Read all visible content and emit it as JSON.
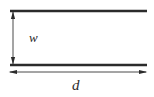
{
  "figure": {
    "kind": "technical-line-diagram",
    "background_color": "#ffffff",
    "stroke_color": "#2b2b2b",
    "canvas": {
      "width": 154,
      "height": 97
    }
  },
  "plates": [
    {
      "name": "upper-plate",
      "x1": 10,
      "x2": 147,
      "y": 11,
      "thickness": 2.6
    },
    {
      "name": "lower-plate",
      "x1": 10,
      "x2": 147,
      "y": 65,
      "thickness": 2.6
    }
  ],
  "dimensions": [
    {
      "name": "vertical-gap",
      "label": "w",
      "orientation": "vertical",
      "x": 13,
      "y1": 11,
      "y2": 65,
      "arrowheads": "both",
      "label_position": {
        "x": 29,
        "y": 31
      }
    },
    {
      "name": "horizontal-length",
      "label": "d",
      "orientation": "horizontal",
      "y": 72,
      "x1": 9,
      "x2": 147,
      "arrowheads": "both",
      "label_position": {
        "x": 72,
        "y": 78
      }
    }
  ]
}
